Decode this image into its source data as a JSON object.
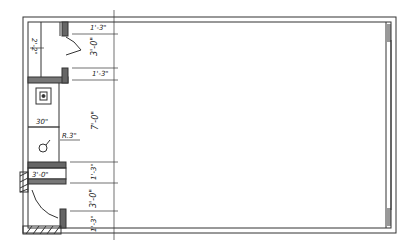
{
  "drawing": {
    "type": "architectural floor plan sketch",
    "colors": {
      "ink": "#333333",
      "poche": "#777777",
      "paper": "#ffffff"
    },
    "dimensions": {
      "closet_width": "2'-2\"",
      "top_jamb": "1'-3\"",
      "top_opening": "3'-0\"",
      "second_jamb": "1'-3\"",
      "middle_run": "7'-0\"",
      "vanity_width": "30\"",
      "lav_radius": "R.3\"",
      "shelf_length": "3'-0\"",
      "lower_jamb": "1'-3\"",
      "door_opening": "3'-0\"",
      "bottom_jamb": "1'-3\""
    }
  }
}
